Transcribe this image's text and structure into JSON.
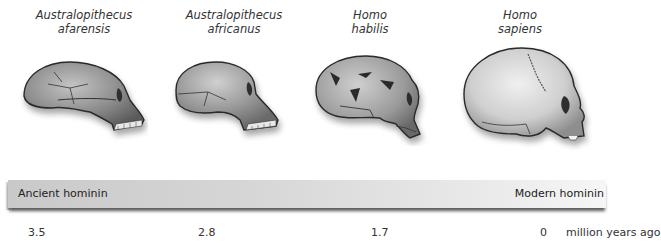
{
  "species": [
    {
      "genus": "Australopithecus",
      "name": "afarensis",
      "mya": "3.5"
    },
    {
      "genus": "Australopithecus",
      "name": "africanus",
      "mya": "2.8"
    },
    {
      "genus": "Homo",
      "name": "habilis",
      "mya": "1.7"
    },
    {
      "genus": "Homo",
      "name": "sapiens",
      "mya": "0"
    }
  ],
  "timeline": {
    "left_label": "Ancient hominin",
    "right_label": "Modern hominin",
    "ticks": [
      "3.5",
      "2.8",
      "1.7",
      "0"
    ],
    "unit": "million years ago"
  },
  "icons": {
    "skull_1": "skull-afarensis-icon",
    "skull_2": "skull-africanus-icon",
    "skull_3": "skull-habilis-icon",
    "skull_4": "skull-sapiens-icon"
  },
  "colors": {
    "bar_left": "#c9c9c9",
    "bar_right": "#f6f6f6",
    "skull_light": "#d8d8d8",
    "skull_dark": "#6e6e6e",
    "outline": "#2a2a2a"
  }
}
